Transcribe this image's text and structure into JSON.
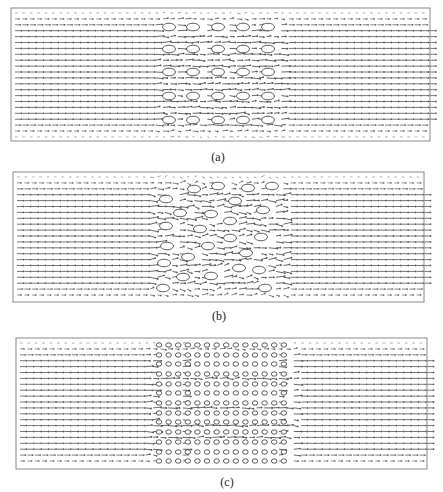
{
  "figure": {
    "background": "#ffffff",
    "border_color": "#8a8a8a",
    "vector_color": "#555555",
    "obstacle_color": "#333333",
    "panels": [
      {
        "id": "a",
        "caption": "(a)",
        "caption_pos": [
          218,
          158
        ],
        "box": [
          11,
          8,
          430,
          141
        ],
        "layout": "aligned",
        "obstacles": {
          "rx": 6.5,
          "ry": 3.8,
          "cols": [
            169,
            193,
            218,
            243,
            268
          ],
          "rows": [
            27,
            49,
            72,
            96,
            120
          ]
        }
      },
      {
        "id": "b",
        "caption": "(b)",
        "caption_pos": [
          219,
          317
        ],
        "box": [
          13,
          172,
          424,
          302
        ],
        "layout": "random",
        "obstacles": {
          "rx": 6.5,
          "ry": 3.8,
          "points": [
            [
              194,
              189
            ],
            [
              218,
              186
            ],
            [
              248,
              188
            ],
            [
              272,
              186
            ],
            [
              166,
              199
            ],
            [
              235,
              201
            ],
            [
              263,
              210
            ],
            [
              180,
              213
            ],
            [
              211,
              214
            ],
            [
              230,
              221
            ],
            [
              166,
              226
            ],
            [
              200,
              229
            ],
            [
              230,
              238
            ],
            [
              261,
              237
            ],
            [
              167,
              246
            ],
            [
              208,
              246
            ],
            [
              246,
              253
            ],
            [
              188,
              257
            ],
            [
              164,
              263
            ],
            [
              239,
              268
            ],
            [
              259,
              270
            ],
            [
              183,
              277
            ],
            [
              211,
              276
            ],
            [
              163,
              288
            ],
            [
              265,
              288
            ]
          ]
        }
      },
      {
        "id": "c",
        "caption": "(c)",
        "caption_pos": [
          227,
          483
        ],
        "box": [
          16,
          338,
          427,
          469
        ],
        "layout": "dense-aligned",
        "obstacles": {
          "rx": 2.8,
          "ry": 2.2,
          "col_start": 159,
          "col_step": 9.6,
          "col_count": 14,
          "rows": [
            345,
            355,
            364,
            374,
            384,
            393,
            403,
            413,
            422,
            432,
            442,
            452,
            461
          ]
        }
      }
    ]
  }
}
